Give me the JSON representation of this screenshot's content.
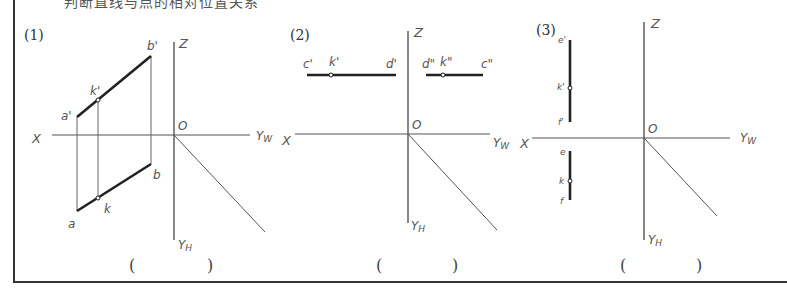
{
  "header": {
    "cutoff_text": "判断直线与点的相对位置关系"
  },
  "frame": {
    "border_color": "#333333",
    "line_color": "#555555",
    "thick_line_color": "#222222"
  },
  "panels": [
    {
      "number": "(1)",
      "axes": {
        "x": "X",
        "z": "Z",
        "origin": "O",
        "yw": "Yw",
        "yh": "YH"
      },
      "points": {
        "a_prime": "a'",
        "k_prime": "k'",
        "b_prime": "b'",
        "a": "a",
        "k": "k",
        "b": "b"
      },
      "answer_open": "(",
      "answer_close": ")"
    },
    {
      "number": "(2)",
      "axes": {
        "x": "X",
        "z": "Z",
        "origin": "O",
        "yw": "Yw",
        "yh": "YH"
      },
      "points": {
        "c_prime": "c'",
        "k_prime": "k'",
        "d_prime": "d'",
        "d_dprime": "d\"",
        "k_dprime": "k\"",
        "c_dprime": "c\""
      },
      "answer_open": "(",
      "answer_close": ")"
    },
    {
      "number": "(3)",
      "axes": {
        "x": "X",
        "z": "Z",
        "origin": "O",
        "yw": "Yw",
        "yh": "YH"
      },
      "points": {
        "e_prime": "e'",
        "k_prime": "k'",
        "f_prime": "f'",
        "e": "e",
        "k": "k",
        "f": "f"
      },
      "answer_open": "(",
      "answer_close": ")"
    }
  ]
}
